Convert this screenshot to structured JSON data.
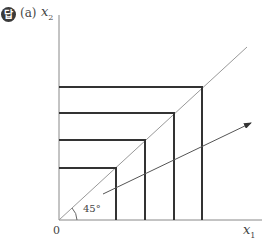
{
  "badge": "답",
  "part_label": "(a)",
  "axes": {
    "y_label": "x",
    "y_sub": "2",
    "x_label": "x",
    "x_sub": "1",
    "origin": "0"
  },
  "angle_label": "45°",
  "diagram": {
    "type": "indifference-curves-perfect-complements",
    "curves": 4,
    "corner_points": [
      [
        116,
        168
      ],
      [
        145,
        140
      ],
      [
        174,
        113
      ],
      [
        202,
        87
      ]
    ],
    "ray_angle_deg": 45,
    "arrow": "direction of increasing utility"
  }
}
